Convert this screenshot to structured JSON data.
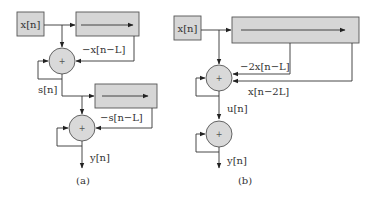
{
  "diagram_a": {
    "input_label": "x[n]",
    "feedback1_label": "−x[n−L]",
    "intermediate_label": "s[n]",
    "feedback2_label": "−s[n−L]",
    "output_label": "y[n]",
    "adder_symbol": "+",
    "caption": "(a)"
  },
  "diagram_b": {
    "input_label": "x[n]",
    "tap1_label": "−2x[n−L]",
    "tap2_label": "x[n−2L]",
    "intermediate_label": "u[n]",
    "output_label": "y[n]",
    "adder_symbol": "+",
    "caption": "(b)"
  },
  "colors": {
    "block_fill": "#d6d6d6",
    "stroke": "#333333"
  }
}
